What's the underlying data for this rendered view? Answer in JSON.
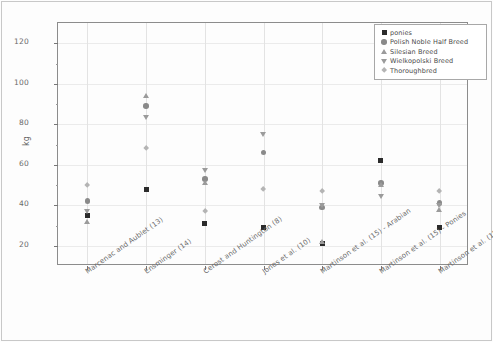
{
  "chart_data": {
    "type": "scatter",
    "title": "",
    "xlabel": "",
    "ylabel": "kg",
    "ylim": [
      10,
      130
    ],
    "yticks": [
      20,
      40,
      60,
      80,
      100,
      120
    ],
    "ytick_labels": [
      "20",
      "40",
      "60",
      "80",
      "100",
      "120"
    ],
    "grid": true,
    "legend_position": "upper right",
    "categories": [
      "Marcenac and Aublet (13)",
      "Ensminger (14)",
      "Cerost and Huntington (8)",
      "Jones et al. (10)",
      "Martinson et al. (15) - Arabian",
      "Martinson et al. (15) - Ponies",
      "Martinson et al. (15) - Stock horses"
    ],
    "series": [
      {
        "name": "ponies",
        "marker": "square",
        "color": "#2b2b2b",
        "values": [
          35,
          48,
          31,
          29,
          21,
          62,
          29
        ]
      },
      {
        "name": "Polish Noble Half Breed",
        "marker": "circle",
        "color": "#8a8a8a",
        "values": [
          42,
          89,
          53,
          66,
          39,
          51,
          41
        ]
      },
      {
        "name": "Silesian Breed",
        "marker": "triangle-up",
        "color": "#9b9b9b",
        "values": [
          32,
          94,
          51,
          null,
          22,
          50,
          38
        ]
      },
      {
        "name": "Wielkopolski Breed",
        "marker": "triangle-down",
        "color": "#9b9b9b",
        "values": [
          37,
          83,
          57,
          75,
          40,
          44,
          40
        ]
      },
      {
        "name": "Thoroughbred",
        "marker": "diamond",
        "color": "#b4b4b4",
        "values": [
          50,
          68,
          37,
          48,
          47,
          119,
          47
        ]
      }
    ]
  },
  "legend": {
    "entries": [
      "ponies",
      "Polish Noble Half Breed",
      "Silesian Breed",
      "Wielkopolski Breed",
      "Thoroughbred"
    ]
  },
  "axis": {
    "y_label": "kg"
  }
}
